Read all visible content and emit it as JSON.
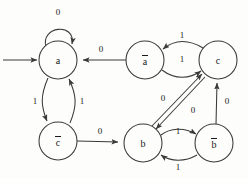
{
  "diagram": {
    "stroke_color": "#3a3a3a",
    "text_color": "#1a1a1a",
    "background_color": "#fdfdfc",
    "node_radius": 19,
    "start_marker": "start-arrow",
    "nodes": [
      {
        "id": "a",
        "label": "a",
        "overline": false,
        "cx": 58,
        "cy": 60
      },
      {
        "id": "a_bar",
        "label": "a",
        "overline": true,
        "cx": 145,
        "cy": 60
      },
      {
        "id": "c",
        "label": "c",
        "overline": false,
        "cx": 218,
        "cy": 60
      },
      {
        "id": "c_bar",
        "label": "c",
        "overline": true,
        "cx": 58,
        "cy": 141
      },
      {
        "id": "b",
        "label": "b",
        "overline": false,
        "cx": 143,
        "cy": 143
      },
      {
        "id": "b_bar",
        "label": "b",
        "overline": true,
        "cx": 214,
        "cy": 143
      }
    ],
    "edges": [
      {
        "id": "start-to-a",
        "from": "start",
        "to": "a",
        "label": "",
        "kind": "entry"
      },
      {
        "id": "a-self-loop",
        "from": "a",
        "to": "a",
        "label": "0",
        "kind": "self-loop",
        "label_x": 58,
        "label_y": 12
      },
      {
        "id": "a_bar-to-a",
        "from": "a_bar",
        "to": "a",
        "label": "0",
        "kind": "straight",
        "label_x": 101,
        "label_y": 49
      },
      {
        "id": "a-to-c_bar",
        "from": "a",
        "to": "c_bar",
        "label": "1",
        "kind": "curve",
        "label_x": 35,
        "label_y": 101
      },
      {
        "id": "c_bar-to-a",
        "from": "c_bar",
        "to": "a",
        "label": "1",
        "kind": "curve",
        "label_x": 82,
        "label_y": 101
      },
      {
        "id": "c_bar-to-b",
        "from": "c_bar",
        "to": "b",
        "label": "0",
        "kind": "straight",
        "label_x": 100,
        "label_y": 131
      },
      {
        "id": "c-to-a_bar",
        "from": "c",
        "to": "a_bar",
        "label": "1",
        "kind": "curve",
        "label_x": 182,
        "label_y": 35
      },
      {
        "id": "a_bar-to-c",
        "from": "a_bar",
        "to": "c",
        "label": "1",
        "kind": "curve",
        "label_x": 182,
        "label_y": 59
      },
      {
        "id": "b-to-c",
        "from": "b",
        "to": "c",
        "label": "0",
        "kind": "diagonal",
        "label_x": 163,
        "label_y": 98
      },
      {
        "id": "c-to-b",
        "from": "c",
        "to": "b",
        "label": "0",
        "kind": "diagonal",
        "label_x": 193,
        "label_y": 110
      },
      {
        "id": "b-to-b_bar",
        "from": "b",
        "to": "b_bar",
        "label": "1",
        "kind": "curve",
        "label_x": 178,
        "label_y": 131
      },
      {
        "id": "b_bar-to-b",
        "from": "b_bar",
        "to": "b",
        "label": "1",
        "kind": "curve",
        "label_x": 178,
        "label_y": 167
      },
      {
        "id": "b_bar-to-c",
        "from": "b_bar",
        "to": "c",
        "label": "0",
        "kind": "straight",
        "label_x": 227,
        "label_y": 101
      }
    ]
  }
}
